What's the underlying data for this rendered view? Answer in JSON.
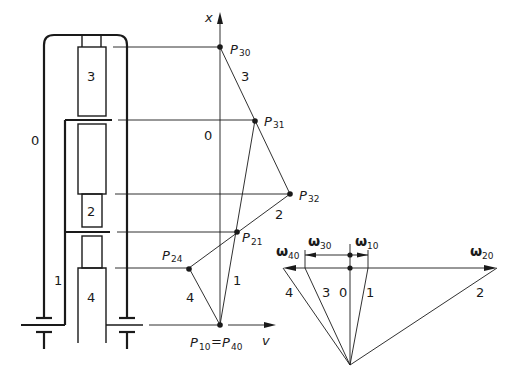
{
  "gear_train": {
    "member_labels": {
      "frame": "0",
      "carrier": "1",
      "planet": "2",
      "ring": "3",
      "sun": "4"
    }
  },
  "velocity_diagram": {
    "axis_x_label": "x",
    "axis_v_label": "v",
    "frame_label": "0",
    "points": [
      {
        "name": "P",
        "sub": "30"
      },
      {
        "name": "P",
        "sub": "31"
      },
      {
        "name": "P",
        "sub": "32"
      },
      {
        "name": "P",
        "sub": "21"
      },
      {
        "name": "P",
        "sub": "24"
      }
    ],
    "origin_label": {
      "left": "P",
      "left_sub": "10",
      "eq": "=",
      "right": "P",
      "right_sub": "40"
    },
    "line_labels": {
      "l3": "3",
      "l2": "2",
      "l1": "1",
      "l4": "4"
    }
  },
  "angular_velocity_diagram": {
    "omega_labels": [
      {
        "sym": "ω",
        "sub": "40"
      },
      {
        "sym": "ω",
        "sub": "30"
      },
      {
        "sym": "ω",
        "sub": "10"
      },
      {
        "sym": "ω",
        "sub": "20"
      }
    ],
    "ray_labels": [
      "4",
      "3",
      "0",
      "1",
      "2"
    ]
  }
}
